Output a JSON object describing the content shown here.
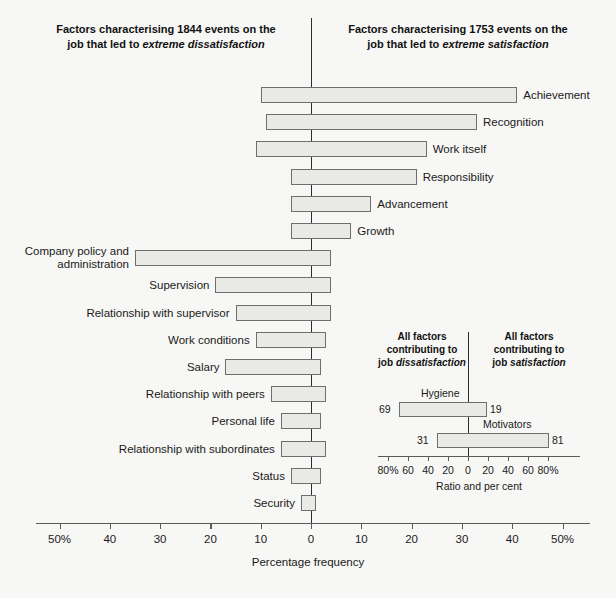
{
  "headers": {
    "left_line1": "Factors characterising 1844 events on the",
    "left_line2_pre": "job that led to ",
    "left_line2_em": "extreme dissatisfaction",
    "right_line1": "Factors characterising 1753 events on the",
    "right_line2_pre": "job that led to ",
    "right_line2_em": "extreme satisfaction"
  },
  "axis": {
    "title": "Percentage frequency",
    "tick_labels": [
      "50%",
      "40",
      "30",
      "20",
      "10",
      "0",
      "10",
      "20",
      "30",
      "40",
      "50%"
    ],
    "tick_values": [
      -50,
      -40,
      -30,
      -20,
      -10,
      0,
      10,
      20,
      30,
      40,
      50
    ],
    "min": -50,
    "max": 50
  },
  "inset": {
    "header_left_line1": "All factors",
    "header_left_line2": "contributing to",
    "header_left_line3_pre": "job ",
    "header_left_line3_em": "dissatisfaction",
    "header_right_line1": "All factors",
    "header_right_line2": "contributing to",
    "header_right_line3_pre": "job ",
    "header_right_line3_em": "satisfaction",
    "axis_title": "Ratio and per cent",
    "tick_labels": [
      "80%",
      "60",
      "40",
      "20",
      "0",
      "20",
      "40",
      "60",
      "80%"
    ],
    "tick_values": [
      -80,
      -60,
      -40,
      -20,
      0,
      20,
      40,
      60,
      80
    ],
    "bars": [
      {
        "name": "Hygiene",
        "left_value": 69,
        "right_value": 19,
        "left_label": "69",
        "right_label": "19"
      },
      {
        "name": "Motivators",
        "left_value": 31,
        "right_value": 81,
        "left_label": "31",
        "right_label": "81"
      }
    ]
  },
  "colors": {
    "background": "#f7f7f5",
    "bar_fill": "#e9e9e6",
    "bar_stroke": "#6e6e6e",
    "zero_line": "#2c2c2c",
    "axis": "#5a5a5a",
    "text": "#1a1a1a"
  },
  "chart_data": {
    "type": "bar",
    "xlabel": "Percentage frequency",
    "ylabel": "",
    "xlim": [
      -50,
      50
    ],
    "grid": false,
    "legend": "none",
    "orientation": "horizontal-diverging",
    "note": "Negative (left) = dissatisfaction frequency; Positive (right) = satisfaction frequency",
    "categories": [
      "Achievement",
      "Recognition",
      "Work itself",
      "Responsibility",
      "Advancement",
      "Growth",
      "Company policy and administration",
      "Supervision",
      "Relationship with supervisor",
      "Work conditions",
      "Salary",
      "Relationship with peers",
      "Personal life",
      "Relationship with subordinates",
      "Status",
      "Security"
    ],
    "series": [
      {
        "name": "Dissatisfaction (left extent, %)",
        "values": [
          10,
          9,
          11,
          4,
          4,
          4,
          35,
          19,
          15,
          11,
          17,
          8,
          6,
          6,
          4,
          2
        ]
      },
      {
        "name": "Satisfaction (right extent, %)",
        "values": [
          41,
          33,
          23,
          21,
          12,
          8,
          4,
          4,
          4,
          3,
          2,
          3,
          2,
          3,
          2,
          1
        ]
      }
    ]
  },
  "rows": [
    {
      "label": "Achievement",
      "neg": 10,
      "pos": 41,
      "side": "right",
      "two_line": false
    },
    {
      "label": "Recognition",
      "neg": 9,
      "pos": 33,
      "side": "right",
      "two_line": false
    },
    {
      "label": "Work itself",
      "neg": 11,
      "pos": 23,
      "side": "right",
      "two_line": false
    },
    {
      "label": "Responsibility",
      "neg": 4,
      "pos": 21,
      "side": "right",
      "two_line": false
    },
    {
      "label": "Advancement",
      "neg": 4,
      "pos": 12,
      "side": "right",
      "two_line": false
    },
    {
      "label": "Growth",
      "neg": 4,
      "pos": 8,
      "side": "right",
      "two_line": false
    },
    {
      "label": "Company policy and administration",
      "neg": 35,
      "pos": 4,
      "side": "left",
      "two_line": true
    },
    {
      "label": "Supervision",
      "neg": 19,
      "pos": 4,
      "side": "left",
      "two_line": false
    },
    {
      "label": "Relationship with supervisor",
      "neg": 15,
      "pos": 4,
      "side": "left",
      "two_line": false
    },
    {
      "label": "Work conditions",
      "neg": 11,
      "pos": 3,
      "side": "left",
      "two_line": false
    },
    {
      "label": "Salary",
      "neg": 17,
      "pos": 2,
      "side": "left",
      "two_line": false
    },
    {
      "label": "Relationship with peers",
      "neg": 8,
      "pos": 3,
      "side": "left",
      "two_line": false
    },
    {
      "label": "Personal life",
      "neg": 6,
      "pos": 2,
      "side": "left",
      "two_line": false
    },
    {
      "label": "Relationship with subordinates",
      "neg": 6,
      "pos": 3,
      "side": "left",
      "two_line": false
    },
    {
      "label": "Status",
      "neg": 4,
      "pos": 2,
      "side": "left",
      "two_line": false
    },
    {
      "label": "Security",
      "neg": 2,
      "pos": 1,
      "side": "left",
      "two_line": false
    }
  ]
}
